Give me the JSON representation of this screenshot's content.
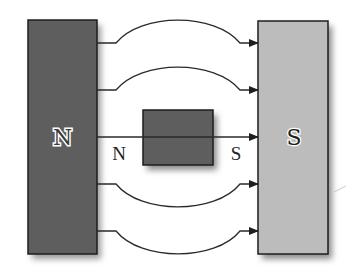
{
  "diagram": {
    "title": "",
    "colors": {
      "background": "#ffffff",
      "north_magnet_fill": "#5e5e5e",
      "south_magnet_fill": "#bcbcbc",
      "small_magnet_fill": "#5e5e5e",
      "outline": "#1e1e1e",
      "field_line": "#2a2a2a",
      "shadow": "#9a9a9a"
    },
    "north_magnet": {
      "label": "N",
      "x": 28,
      "y": 20,
      "width": 69,
      "height": 234
    },
    "south_magnet": {
      "label": "S",
      "x": 258,
      "y": 21,
      "width": 70,
      "height": 233
    },
    "small_magnet": {
      "x": 143,
      "y": 110,
      "width": 70,
      "height": 55,
      "left_label": "N",
      "right_label": "S"
    },
    "field_lines": [
      {
        "y": 43,
        "apex_y": 20,
        "direction": "N-to-S"
      },
      {
        "y": 90,
        "apex_y": 67,
        "direction": "N-to-S"
      },
      {
        "y": 137,
        "apex_y": 137,
        "direction": "N-to-S"
      },
      {
        "y": 184,
        "apex_y": 207,
        "direction": "N-to-S"
      },
      {
        "y": 231,
        "apex_y": 254,
        "direction": "N-to-S"
      }
    ]
  }
}
